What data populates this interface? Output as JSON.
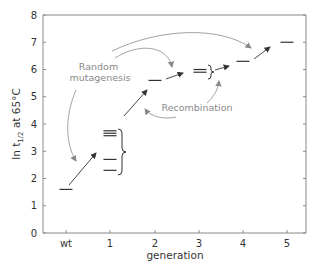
{
  "chart_data": {
    "type": "scatter",
    "title": "",
    "xlabel": "generation",
    "ylabel": "ln t1/2 at 65°C",
    "ylabel_parts": {
      "pre": "ln t",
      "sub": "1/2",
      "post": " at 65°C"
    },
    "categories": [
      "wt",
      "1",
      "2",
      "3",
      "4",
      "5"
    ],
    "ylim": [
      0,
      8
    ],
    "yticks": [
      "0",
      "1",
      "2",
      "3",
      "4",
      "5",
      "6",
      "7",
      "8"
    ],
    "grid": false,
    "legend": null,
    "marker": "horizontal-dash",
    "points": [
      {
        "x": "wt",
        "values": [
          1.6
        ]
      },
      {
        "x": "1",
        "values": [
          3.75,
          3.66,
          3.57,
          2.7,
          2.3
        ]
      },
      {
        "x": "2",
        "values": [
          5.6
        ]
      },
      {
        "x": "3",
        "values": [
          6.0,
          5.9
        ]
      },
      {
        "x": "4",
        "values": [
          6.3
        ]
      },
      {
        "x": "5",
        "values": [
          7.0
        ]
      }
    ],
    "annotations": [
      {
        "text_lines": [
          "Random",
          "mutagenesis"
        ],
        "points_to": [
          "1",
          "3",
          "4"
        ]
      },
      {
        "text": "Recombination",
        "points_to": [
          "2-3 (from 1)",
          "4 (from 3)"
        ]
      }
    ]
  },
  "annotations": {
    "random_line1": "Random",
    "random_line2": "mutagenesis",
    "recombination": "Recombination"
  },
  "colors": {
    "axis": "#777777",
    "marker": "#333333",
    "arrow": "#333333",
    "annotation": "#8a8a8a"
  }
}
